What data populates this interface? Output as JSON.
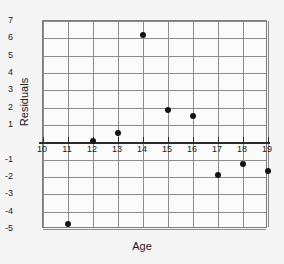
{
  "chart_data": {
    "type": "scatter",
    "title": "",
    "xlabel": "Age",
    "ylabel": "Residuals",
    "xlim": [
      10,
      19
    ],
    "ylim": [
      -5,
      7
    ],
    "grid": true,
    "legend": null,
    "xticks": [
      "10",
      "11",
      "12",
      "13",
      "14",
      "15",
      "16",
      "17",
      "18",
      "19"
    ],
    "yticks": [
      "7",
      "6",
      "5",
      "4",
      "3",
      "2",
      "1",
      "-1",
      "-2",
      "-3",
      "-4",
      "-5"
    ],
    "zero_reference_line": 0,
    "x": [
      11,
      12,
      13,
      14,
      15,
      16,
      17,
      18,
      19
    ],
    "y": [
      -4.7,
      0.05,
      0.55,
      6.2,
      1.85,
      1.5,
      -1.9,
      -1.25,
      -1.65
    ],
    "points": [
      {
        "x": 11,
        "y": -4.7
      },
      {
        "x": 12,
        "y": 0.05
      },
      {
        "x": 13,
        "y": 0.55
      },
      {
        "x": 14,
        "y": 6.2
      },
      {
        "x": 15,
        "y": 1.85
      },
      {
        "x": 16,
        "y": 1.5
      },
      {
        "x": 17,
        "y": -1.9
      },
      {
        "x": 18,
        "y": -1.25
      },
      {
        "x": 19,
        "y": -1.65
      }
    ],
    "colors": {
      "marker": "#141414",
      "grid": "#8c8c8c",
      "frame": "#7d7d7d",
      "zero_line": "#2b2b2b",
      "background": "#f5f5f5",
      "plot_background": "#fbfbfb"
    }
  }
}
